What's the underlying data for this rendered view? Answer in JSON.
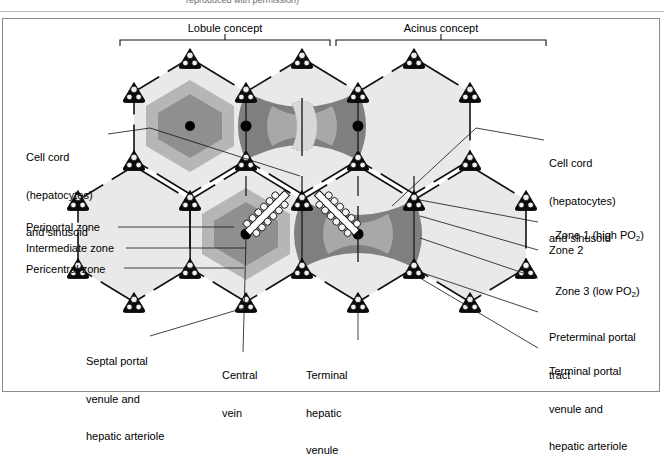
{
  "figure": {
    "caption_cut": "reproduced with permission)",
    "headers": [
      {
        "key": "lobule",
        "label": "Lobule concept"
      },
      {
        "key": "acinus",
        "label": "Acinus concept"
      }
    ]
  },
  "labels": {
    "left": [
      {
        "name": "cell-cord-left",
        "lines": [
          "Cell cord",
          "(hepatocytes)",
          "and sinusoid"
        ]
      },
      {
        "name": "periportal-zone",
        "lines": [
          "Periportal zone"
        ]
      },
      {
        "name": "intermediate-zone",
        "lines": [
          "Intermediate zone"
        ]
      },
      {
        "name": "pericentral-zone",
        "lines": [
          "Pericentral zone"
        ]
      }
    ],
    "right": [
      {
        "name": "cell-cord-right",
        "lines": [
          "Cell cord",
          "(hepatocytes)",
          "and sinusoid"
        ]
      },
      {
        "name": "zone-1",
        "lines": [
          "Zone 1 (high PO2)"
        ],
        "sub": "2",
        "pre": "Zone 1 (high PO",
        "post": ")"
      },
      {
        "name": "zone-2",
        "lines": [
          "Zone 2"
        ]
      },
      {
        "name": "zone-3",
        "lines": [
          "Zone 3 (low PO2)"
        ],
        "sub": "2",
        "pre": "Zone 3 (low PO",
        "post": ")"
      },
      {
        "name": "preterminal-portal-tract",
        "lines": [
          "Preterminal portal",
          "tract"
        ]
      },
      {
        "name": "terminal-portal-venule",
        "lines": [
          "Terminal portal",
          "venule and",
          "hepatic arteriole"
        ]
      }
    ],
    "bottom": [
      {
        "name": "septal-portal-venule",
        "lines": [
          "Septal portal",
          "venule and",
          "hepatic arteriole"
        ]
      },
      {
        "name": "central-vein",
        "lines": [
          "Central",
          "vein"
        ]
      },
      {
        "name": "terminal-hepatic-venule",
        "lines": [
          "Terminal",
          "hepatic",
          "venule"
        ]
      }
    ]
  },
  "colors": {
    "parenchyma": "#e9e9e9",
    "zone_mid": "#b6b6b6",
    "zone_inner": "#8f8f8f",
    "acinus_outer": "#7f7f7f",
    "acinus_mid": "#a8a8a8",
    "acinus_inner": "#d2d2d2",
    "outline": "#000000",
    "frame": "#8a8a8a"
  }
}
